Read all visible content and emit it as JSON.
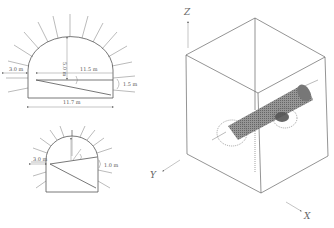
{
  "figure": {
    "panels": [
      {
        "id": "large-tunnel-section",
        "labels": {
          "left_offset": "3.0 m",
          "height": "5.0 m",
          "inner_width": "11.5 m",
          "right_offset": "1.5 m",
          "overall_width": "11.7 m"
        }
      },
      {
        "id": "small-tunnel-section",
        "labels": {
          "left_offset": "3.0 m",
          "right_offset": "1.0 m"
        }
      },
      {
        "id": "3d-model-view",
        "axes": {
          "z": "Z",
          "y": "Y",
          "x": "X"
        }
      }
    ]
  },
  "colors": {
    "line": "#555555",
    "tunnel_mesh": "#6a6a6a",
    "background": "#ffffff"
  }
}
